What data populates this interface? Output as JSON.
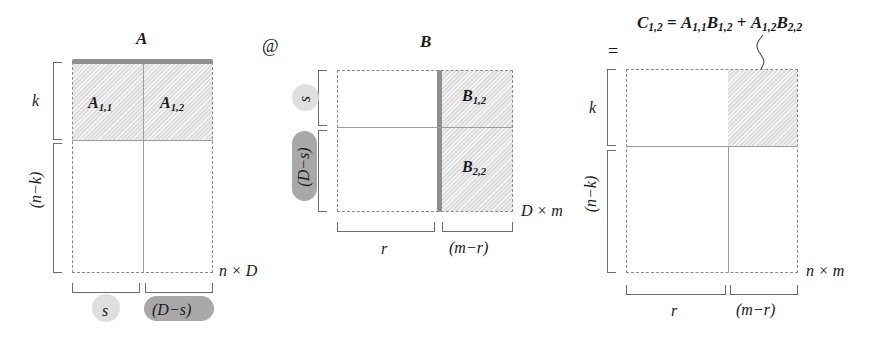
{
  "figure": {
    "type": "block-matrix-multiplication-diagram",
    "operator_between_A_and_B": "@",
    "operator_before_C": "=",
    "result_equation": "C1,2 = A1,1B1,2 + A1,2B2,2"
  },
  "equation": {
    "lhs_name": "C",
    "lhs_sub": "1,2",
    "eq": "=",
    "t1_name": "A",
    "t1_sub": "1,1",
    "t2_name": "B",
    "t2_sub": "1,2",
    "plus": "+",
    "t3_name": "A",
    "t3_sub": "1,2",
    "t4_name": "B",
    "t4_sub": "2,2"
  },
  "matrix_a": {
    "name": "A",
    "size_label": "n × D",
    "blocks": [
      {
        "name": "A",
        "sub": "1,1",
        "shaded": true
      },
      {
        "name": "A",
        "sub": "1,2",
        "shaded": true
      }
    ],
    "row_brackets": [
      {
        "label": "k"
      },
      {
        "label": "(n−k)"
      }
    ],
    "col_brackets": [
      {
        "label": "s",
        "highlight": "light"
      },
      {
        "label": "(D−s)",
        "highlight": "dark"
      }
    ]
  },
  "matrix_b": {
    "name": "B",
    "size_label": "D × m",
    "blocks": [
      {
        "name": "B",
        "sub": "1,2",
        "shaded": true
      },
      {
        "name": "B",
        "sub": "2,2",
        "shaded": true
      }
    ],
    "row_brackets": [
      {
        "label": "s",
        "highlight": "light"
      },
      {
        "label": "(D−s)",
        "highlight": "dark"
      }
    ],
    "col_brackets": [
      {
        "label": "r"
      },
      {
        "label": "(m−r)"
      }
    ]
  },
  "matrix_c": {
    "name": "C",
    "size_label": "n × m",
    "blocks": [
      {
        "name": "C",
        "sub": "1,2",
        "shaded": true
      }
    ],
    "row_brackets": [
      {
        "label": "k"
      },
      {
        "label": "(n−k)"
      }
    ],
    "col_brackets": [
      {
        "label": "r"
      },
      {
        "label": "(m−r)"
      }
    ]
  },
  "colors": {
    "shade_fill": "#dedede",
    "dash_stroke": "#8a8a8a",
    "bar_stroke": "#8f8f8f",
    "highlight_light": "#d9d9d9",
    "highlight_dark": "#a8a8a8",
    "text": "#1a1a1a"
  }
}
